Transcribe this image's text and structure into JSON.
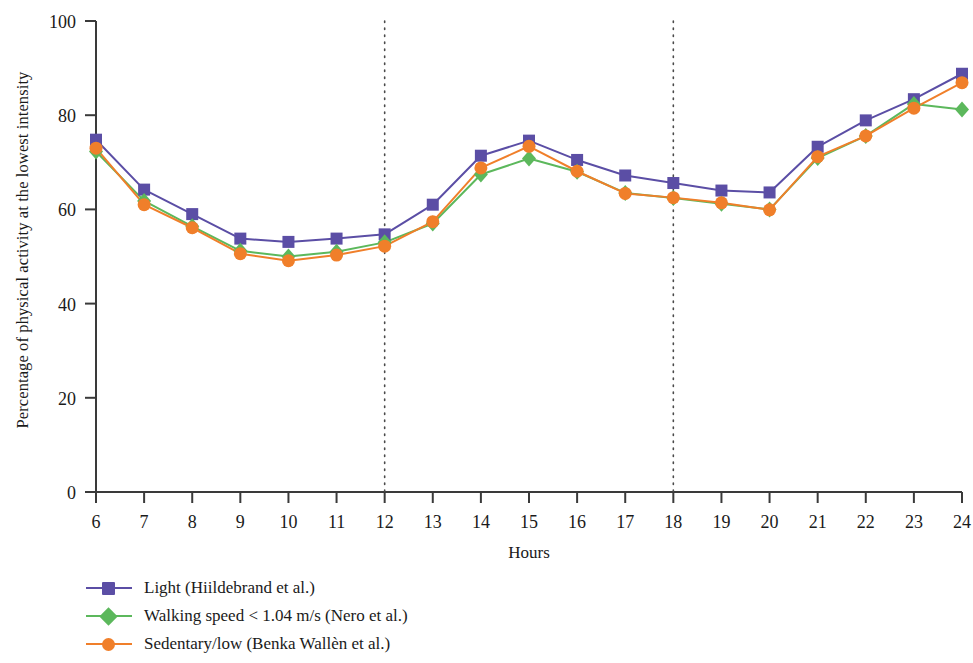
{
  "chart_data": {
    "type": "line",
    "title": "",
    "xlabel": "Hours",
    "ylabel": "Percentage of physical activity at the lowest intensity",
    "x": [
      6,
      7,
      8,
      9,
      10,
      11,
      12,
      13,
      14,
      15,
      16,
      17,
      18,
      19,
      20,
      21,
      22,
      23,
      24
    ],
    "xtick_labels": [
      "6",
      "7",
      "8",
      "9",
      "10",
      "11",
      "12",
      "13",
      "14",
      "15",
      "16",
      "17",
      "18",
      "19",
      "20",
      "21",
      "22",
      "23",
      "24"
    ],
    "ytick_labels": [
      "0",
      "20",
      "40",
      "60",
      "80",
      "100"
    ],
    "yticks": [
      0,
      20,
      40,
      60,
      80,
      100
    ],
    "xlim": [
      6,
      24
    ],
    "ylim": [
      0,
      100
    ],
    "grid": false,
    "reference_lines": [
      12,
      18
    ],
    "legend_position": "below-left",
    "series": [
      {
        "name": "Light (Hiildebrand et al.)",
        "color": "#5b4ea5",
        "marker": "square",
        "values": [
          74.8,
          64.2,
          59.0,
          53.8,
          53.1,
          53.8,
          54.7,
          61.0,
          71.4,
          74.6,
          70.5,
          67.2,
          65.6,
          64.0,
          63.6,
          73.3,
          78.9,
          83.4,
          88.8
        ]
      },
      {
        "name": "Walking speed < 1.04 m/s (Nero et al.)",
        "color": "#5cb85c",
        "marker": "diamond",
        "values": [
          72.3,
          61.8,
          56.4,
          51.2,
          50.0,
          51.0,
          53.0,
          57.0,
          67.4,
          70.8,
          68.0,
          63.5,
          62.4,
          61.2,
          60.0,
          70.9,
          75.6,
          82.4,
          81.2
        ]
      },
      {
        "name": "Sedentary/low (Benka Wallèn et al.)",
        "color": "#f07f2a",
        "marker": "circle",
        "values": [
          73.0,
          61.0,
          56.1,
          50.6,
          49.1,
          50.3,
          52.2,
          57.4,
          68.8,
          73.4,
          68.1,
          63.4,
          62.5,
          61.4,
          59.9,
          71.2,
          75.6,
          81.5,
          86.9
        ]
      }
    ]
  },
  "legend": {
    "items": [
      {
        "label": "Light (Hiildebrand et al.)"
      },
      {
        "label": "Walking speed < 1.04 m/s (Nero et al.)"
      },
      {
        "label": "Sedentary/low (Benka Wallèn et al.)"
      }
    ]
  }
}
